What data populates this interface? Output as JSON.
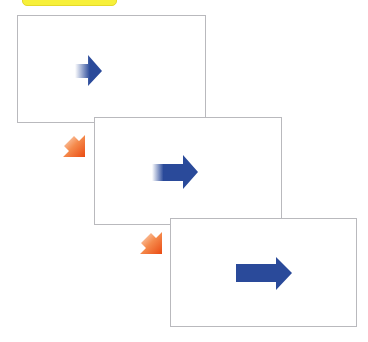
{
  "header": {
    "label_text": ""
  },
  "colors": {
    "label_background": "#f7f03a",
    "panel_border": "#b9b9bd",
    "motion_arrow": "#2a4a9a",
    "transition_arrow_start": "#fde2cf",
    "transition_arrow_end": "#ea4a12"
  },
  "panels": [
    {
      "id": "frame-1",
      "arrow": "right-arrow",
      "arrow_length": "short"
    },
    {
      "id": "frame-2",
      "arrow": "right-arrow",
      "arrow_length": "medium"
    },
    {
      "id": "frame-3",
      "arrow": "right-arrow",
      "arrow_length": "long"
    }
  ],
  "transitions": [
    {
      "from": "frame-1",
      "to": "frame-2",
      "icon": "diagonal-down-left-arrow"
    },
    {
      "from": "frame-2",
      "to": "frame-3",
      "icon": "diagonal-down-left-arrow"
    }
  ]
}
